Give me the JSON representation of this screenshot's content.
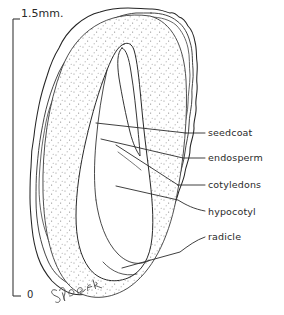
{
  "figure": {
    "subject": "seed",
    "style": "ink line drawing with stipple shading",
    "background_color": "#ffffff",
    "ink_color": "#1a1a1a"
  },
  "scale_bar": {
    "top_label": "1.5mm.",
    "bottom_label": "0",
    "orientation": "vertical",
    "unit": "mm",
    "length_value": "1.5"
  },
  "labels": [
    {
      "id": "seedcoat",
      "text": "seedcoat"
    },
    {
      "id": "endosperm",
      "text": "endosperm"
    },
    {
      "id": "cotyledons",
      "text": "cotyledons"
    },
    {
      "id": "hypocotyl",
      "text": "hypocotyl"
    },
    {
      "id": "radicle",
      "text": "radicle"
    }
  ],
  "signature": {
    "text": "S. Foster",
    "style": "cursive handwriting"
  }
}
